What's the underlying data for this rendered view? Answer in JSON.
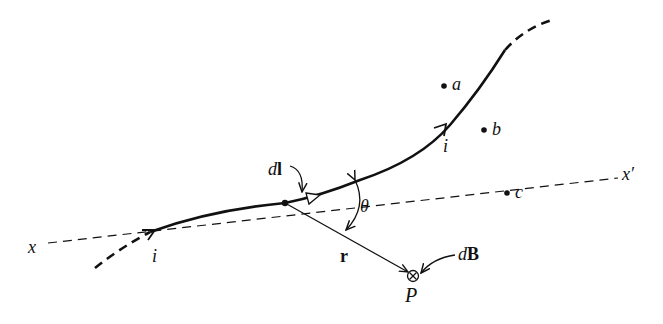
{
  "diagram": {
    "labels": {
      "axis_start": "x",
      "axis_end": "x′",
      "current_lower": "i",
      "current_upper": "i",
      "element": "dl",
      "element_d": "d",
      "element_l": "l",
      "angle": "θ",
      "radius": "r",
      "point": "P",
      "field": "dB",
      "field_d": "d",
      "field_B": "B",
      "point_a": "a",
      "point_b": "b",
      "point_c": "c"
    },
    "symbols": {
      "field_direction": "into-page (⊗)"
    },
    "colors": {
      "ink": "#111111",
      "background": "#ffffff"
    }
  }
}
